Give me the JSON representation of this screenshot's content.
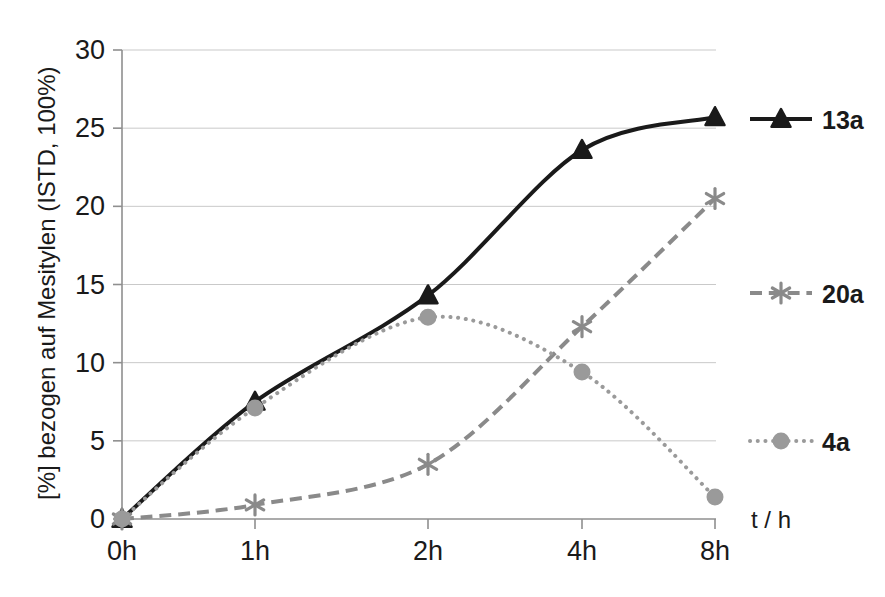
{
  "chart_data": {
    "type": "line",
    "title": "",
    "xlabel": "t / h",
    "ylabel": "[%] bezogen auf Mesitylen (ISTD, 100%)",
    "categories": [
      "0h",
      "1h",
      "2h",
      "4h",
      "8h"
    ],
    "ytick_labels": [
      "0",
      "5",
      "10",
      "15",
      "20",
      "25",
      "30"
    ],
    "ylim": [
      0,
      30
    ],
    "ytick_step": 5,
    "grid": "horizontal",
    "legend_position": "right",
    "series": [
      {
        "name": "13a",
        "values": [
          0,
          7.5,
          14.3,
          23.6,
          25.7
        ],
        "color": "#1a1a1a",
        "line_style": "solid",
        "marker": "triangle",
        "line_width": 4
      },
      {
        "name": "20a",
        "values": [
          0,
          0.9,
          3.5,
          12.3,
          20.5
        ],
        "color": "#8a8a8a",
        "line_style": "dashed",
        "marker": "star",
        "line_width": 4
      },
      {
        "name": "4a",
        "values": [
          0,
          7.1,
          12.9,
          9.4,
          1.4
        ],
        "color": "#9a9a9a",
        "line_style": "dotted",
        "marker": "circle",
        "line_width": 4
      }
    ]
  },
  "legend": {
    "items": [
      {
        "label": "13a"
      },
      {
        "label": "20a"
      },
      {
        "label": "4a"
      }
    ]
  },
  "axes": {
    "y_title": "[%] bezogen auf Mesitylen (ISTD, 100%)",
    "x_title": "t / h",
    "y_ticks": [
      "30",
      "25",
      "20",
      "15",
      "10",
      "5",
      "0"
    ],
    "x_ticks": [
      "0h",
      "1h",
      "2h",
      "4h",
      "8h"
    ]
  },
  "colors": {
    "series_13a": "#1a1a1a",
    "series_20a": "#8a8a8a",
    "series_4a": "#9a9a9a",
    "grid": "#c9c9c9",
    "axis": "#8f8f8f",
    "background": "#ffffff"
  }
}
